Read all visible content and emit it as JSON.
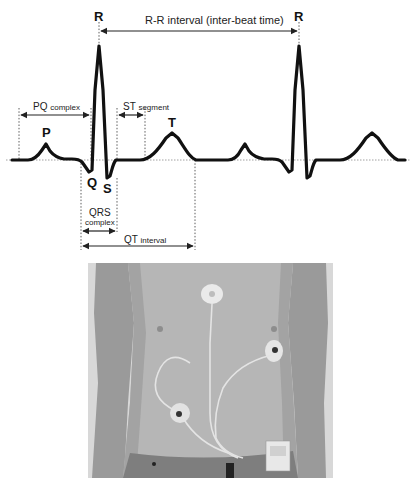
{
  "figure": {
    "ecg_trace": {
      "wave_labels": {
        "r1": "R",
        "r2": "R",
        "p": "P",
        "q": "Q",
        "s": "S",
        "t": "T"
      },
      "interval_labels": {
        "rr": "R-R interval (inter-beat time)",
        "pq_main": "PQ",
        "pq_sub": "complex",
        "st_main": "ST",
        "st_sub": "segment",
        "qrs_main": "QRS",
        "qrs_sub": "complex",
        "qt_main": "QT",
        "qt_sub": "interval"
      },
      "colors": {
        "trace": "#111111",
        "baseline": "#888888",
        "annotation": "#222222"
      }
    },
    "photo": {
      "description": "Torso with three ECG electrodes and a Holter recorder attached at the waist",
      "electrodes": [
        "upper-sternum",
        "left-chest",
        "right-abdomen"
      ]
    }
  }
}
